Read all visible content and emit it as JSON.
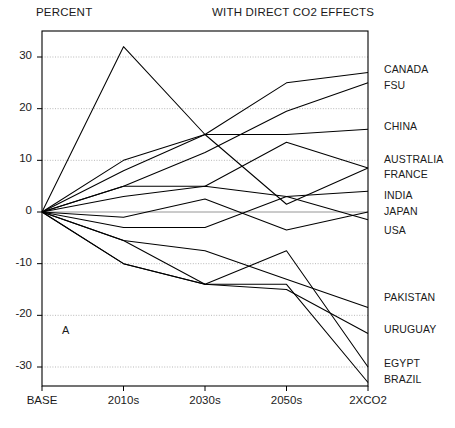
{
  "header": {
    "left_label": "PERCENT",
    "right_label": "WITH DIRECT CO2 EFFECTS"
  },
  "panel_tag": "A",
  "chart_data": {
    "type": "line",
    "title": "WITH DIRECT CO2 EFFECTS",
    "xlabel": "",
    "ylabel": "PERCENT",
    "categories": [
      "BASE",
      "2010s",
      "2030s",
      "2050s",
      "2XCO2"
    ],
    "xticklabels": [
      "BASE",
      "2010s",
      "2030s",
      "2050s",
      "2XCO2"
    ],
    "yticklabels": [
      "30",
      "20",
      "10",
      "0",
      "-10",
      "-20",
      "-30"
    ],
    "yticks": [
      30,
      20,
      10,
      0,
      -10,
      -20,
      -30
    ],
    "ylim": [
      -35,
      35
    ],
    "grid": true,
    "legend_position": "right-of-axes",
    "annotations": [
      "A"
    ],
    "series": [
      {
        "name": "CANADA",
        "values": [
          0,
          10.0,
          15.0,
          25.0,
          27.0
        ]
      },
      {
        "name": "FSU",
        "values": [
          0,
          5.0,
          11.5,
          19.5,
          25.0
        ]
      },
      {
        "name": "CHINA",
        "values": [
          0,
          8.0,
          15.0,
          15.0,
          16.0
        ]
      },
      {
        "name": "AUSTRALIA",
        "values": [
          0,
          5.0,
          5.0,
          13.5,
          8.5
        ]
      },
      {
        "name": "FRANCE",
        "values": [
          0,
          32.0,
          15.0,
          1.5,
          8.5
        ]
      },
      {
        "name": "INDIA",
        "values": [
          0,
          3.0,
          5.0,
          3.0,
          4.0
        ]
      },
      {
        "name": "JAPAN",
        "values": [
          0,
          -1.0,
          2.5,
          -3.5,
          0.0
        ]
      },
      {
        "name": "USA",
        "values": [
          0,
          -3.0,
          -3.0,
          3.0,
          -1.5
        ]
      },
      {
        "name": "PAKISTAN",
        "values": [
          0,
          -5.5,
          -7.5,
          -13.0,
          -18.5
        ]
      },
      {
        "name": "URUGUAY",
        "values": [
          0,
          -5.5,
          -14.0,
          -15.0,
          -23.5
        ]
      },
      {
        "name": "EGYPT",
        "values": [
          0,
          -10.0,
          -14.0,
          -7.5,
          -30.0
        ]
      },
      {
        "name": "BRAZIL",
        "values": [
          0,
          -10.0,
          -14.0,
          -14.0,
          -33.0
        ]
      }
    ],
    "label_anchor_y": [
      27.0,
      25.0,
      16.0,
      8.5,
      8.5,
      4.0,
      0.0,
      -1.5,
      -18.5,
      -23.5,
      -30.0,
      -33.0
    ]
  }
}
